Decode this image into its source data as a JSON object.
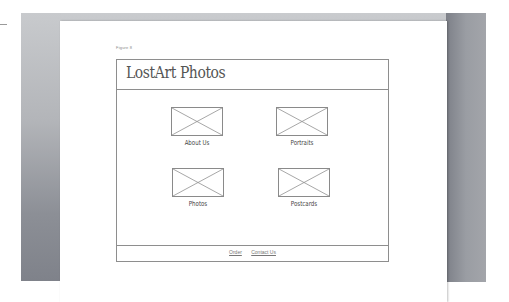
{
  "document": {
    "figure_label": "Figure 8",
    "wireframe": {
      "site_title": "LostArt Photos",
      "tiles": [
        {
          "label": "About Us",
          "icon": "image-placeholder-icon"
        },
        {
          "label": "Portraits",
          "icon": "image-placeholder-icon"
        },
        {
          "label": "Photos",
          "icon": "image-placeholder-icon"
        },
        {
          "label": "Postcards",
          "icon": "image-placeholder-icon"
        }
      ],
      "footer_links": [
        {
          "label": "Order"
        },
        {
          "label": "Contact Us"
        }
      ]
    }
  },
  "colors": {
    "frame_gray": "#a9abb0",
    "wire_border": "#8e8e8e",
    "paper": "#ffffff"
  }
}
